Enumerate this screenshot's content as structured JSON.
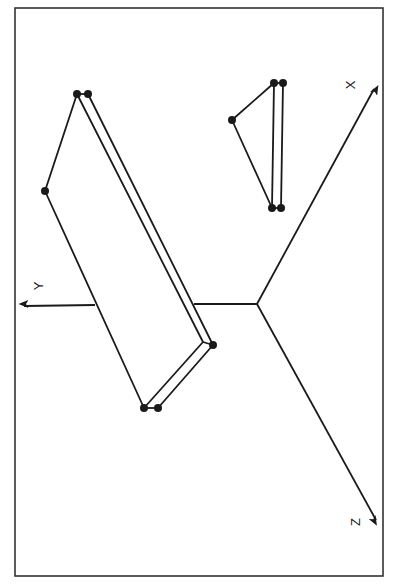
{
  "figure": {
    "colors": {
      "background": "#ffffff",
      "ink": "#1a1a1a",
      "frame": "#333333"
    },
    "frame": {
      "x": 15,
      "y": 8,
      "width": 368,
      "height": 568
    },
    "origin": {
      "x": 257,
      "y": 304
    },
    "axes": [
      {
        "name": "X",
        "label": "X",
        "tip": {
          "x": 374,
          "y": 89
        },
        "label_pos": {
          "x": 352,
          "y": 85
        }
      },
      {
        "name": "Y",
        "label": "Y",
        "tip": {
          "x": 22,
          "y": 306
        },
        "label_pos": {
          "x": 40,
          "y": 286
        }
      },
      {
        "name": "Z",
        "label": "Z",
        "tip": {
          "x": 376,
          "y": 520
        },
        "label_pos": {
          "x": 357,
          "y": 522
        }
      }
    ],
    "large_plate": {
      "vertices": [
        {
          "x": 77,
          "y": 94
        },
        {
          "x": 88,
          "y": 94
        },
        {
          "x": 45,
          "y": 191
        },
        {
          "x": 144,
          "y": 408
        },
        {
          "x": 158,
          "y": 408
        },
        {
          "x": 213,
          "y": 345
        }
      ]
    },
    "small_plate": {
      "vertices": [
        {
          "x": 232,
          "y": 120
        },
        {
          "x": 274,
          "y": 83
        },
        {
          "x": 283,
          "y": 83
        },
        {
          "x": 272,
          "y": 208
        },
        {
          "x": 281,
          "y": 208
        }
      ]
    }
  }
}
